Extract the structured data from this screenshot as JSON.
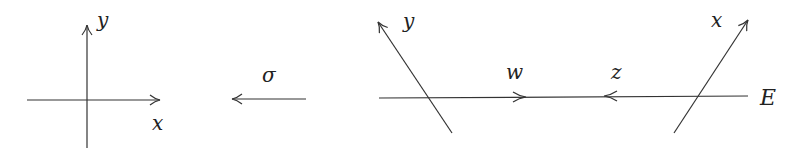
{
  "diagram": {
    "stroke_color": "#333333",
    "text_color": "#222222",
    "left_axes": {
      "x_label": "x",
      "y_label": "y"
    },
    "map": {
      "label": "σ",
      "direction": "left"
    },
    "right_figure": {
      "line_label": "E",
      "left_line_label": "y",
      "right_line_label": "x",
      "arrow_right_label": "w",
      "arrow_left_label": "z"
    }
  }
}
